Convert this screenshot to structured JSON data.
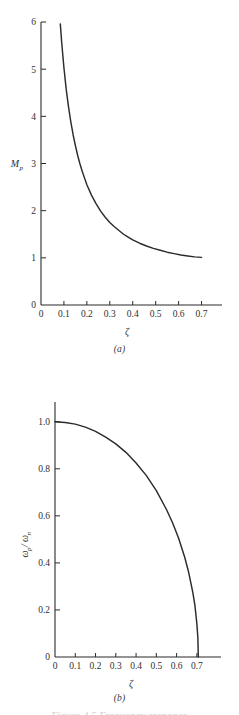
{
  "figure": {
    "footer_text": "Figure 4.5  Frequency response",
    "background_color": "#ffffff",
    "line_color": "#2b2b2b"
  },
  "panels": [
    {
      "id": "a",
      "caption": "(a)",
      "chart_data": {
        "type": "line",
        "title": "",
        "xlabel": "ζ",
        "ylabel": "M",
        "ylabel_sub": "p",
        "xlim": [
          0,
          0.75
        ],
        "ylim": [
          0,
          6
        ],
        "grid": false,
        "legend": "none",
        "xticks": [
          0,
          0.1,
          0.2,
          0.3,
          0.4,
          0.5,
          0.6,
          0.7
        ],
        "xtick_labels": [
          "0",
          "0.1",
          "0.2",
          "0.3",
          "0.4",
          "0.5",
          "0.6",
          "0.7"
        ],
        "yticks": [
          0,
          1,
          2,
          3,
          4,
          5,
          6
        ],
        "ytick_labels": [
          "0",
          "1",
          "2",
          "3",
          "4",
          "5",
          "6"
        ],
        "series": [
          {
            "name": "Mp",
            "x": [
              0.0842,
              0.09,
              0.1,
              0.11,
              0.12,
              0.13,
              0.14,
              0.15,
              0.16,
              0.17,
              0.18,
              0.19,
              0.2,
              0.22,
              0.24,
              0.26,
              0.28,
              0.3,
              0.32,
              0.34,
              0.36,
              0.38,
              0.4,
              0.43,
              0.46,
              0.49,
              0.52,
              0.55,
              0.58,
              0.61,
              0.64,
              0.67,
              0.7
            ],
            "y": [
              5.96,
              5.58,
              5.03,
              4.57,
              4.2,
              3.88,
              3.61,
              3.38,
              3.17,
              2.99,
              2.83,
              2.69,
              2.55,
              2.33,
              2.15,
              1.99,
              1.86,
              1.75,
              1.66,
              1.58,
              1.5,
              1.44,
              1.38,
              1.31,
              1.25,
              1.2,
              1.16,
              1.12,
              1.09,
              1.06,
              1.04,
              1.02,
              1.01
            ]
          }
        ]
      }
    },
    {
      "id": "b",
      "caption": "(b)",
      "chart_data": {
        "type": "line",
        "title": "",
        "xlabel": "ζ",
        "ylabel_num": "ω",
        "ylabel_num_sub": "p",
        "ylabel_den": "ω",
        "ylabel_den_sub": "n",
        "ylabel": "ωp/ωn",
        "xlim": [
          0,
          0.75
        ],
        "ylim": [
          0,
          1.05
        ],
        "grid": false,
        "legend": "none",
        "xticks": [
          0,
          0.1,
          0.2,
          0.3,
          0.4,
          0.5,
          0.6,
          0.7
        ],
        "xtick_labels": [
          "0",
          "0.1",
          "0.2",
          "0.3",
          "0.4",
          "0.5",
          "0.6",
          "0.7"
        ],
        "yticks": [
          0,
          0.2,
          0.4,
          0.6,
          0.8,
          1.0
        ],
        "ytick_labels": [
          "0",
          "0.2",
          "0.4",
          "0.6",
          "0.8",
          "1.0"
        ],
        "series": [
          {
            "name": "wp/wn",
            "x": [
              0.0,
              0.05,
              0.1,
              0.15,
              0.2,
              0.25,
              0.3,
              0.35,
              0.4,
              0.45,
              0.5,
              0.55,
              0.58,
              0.61,
              0.64,
              0.66,
              0.68,
              0.69,
              0.7,
              0.705,
              0.7071
            ],
            "y": [
              1.0,
              0.997,
              0.99,
              0.977,
              0.959,
              0.935,
              0.906,
              0.87,
              0.825,
              0.772,
              0.707,
              0.627,
              0.571,
              0.505,
              0.424,
              0.358,
              0.275,
              0.222,
              0.141,
              0.081,
              0.0
            ]
          }
        ]
      }
    }
  ]
}
